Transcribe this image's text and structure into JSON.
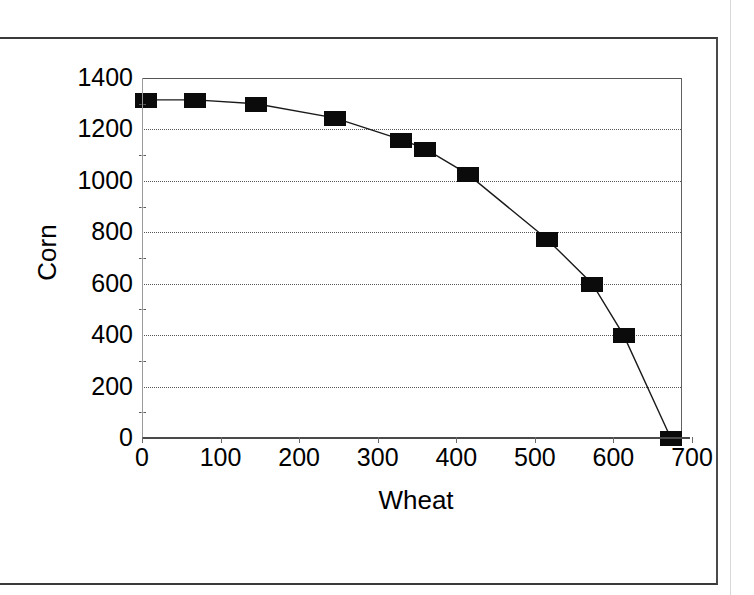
{
  "figure": {
    "background_color": "#ffffff",
    "ink_color": "#000000",
    "marker_color": "#0b0b0b"
  },
  "chart_data": {
    "type": "line",
    "title": "",
    "subtitle": "",
    "xlabel": "Wheat",
    "ylabel": "Corn",
    "xlim": [
      0,
      700
    ],
    "ylim": [
      0,
      1400
    ],
    "x_ticks": [
      0,
      100,
      200,
      300,
      400,
      500,
      600,
      700
    ],
    "x_tick_labels": [
      "0",
      "100",
      "200",
      "300",
      "400",
      "500",
      "600",
      "700"
    ],
    "y_ticks": [
      0,
      200,
      400,
      600,
      800,
      1000,
      1200,
      1400
    ],
    "y_tick_labels": [
      "0",
      "200",
      "400",
      "600",
      "800",
      "1000",
      "1200",
      "1400"
    ],
    "y_minor_ticks": [
      100,
      300,
      500,
      700,
      900,
      1100,
      1300
    ],
    "grid": true,
    "grid_axis": "y",
    "grid_style": "dotted",
    "legend": false,
    "legend_position": "none",
    "marker_style": "filled-square",
    "line_style": "solid",
    "series": [
      {
        "name": "Production possibilities frontier",
        "x": [
          5,
          68,
          145,
          245,
          330,
          360,
          415,
          515,
          573,
          613,
          673
        ],
        "y": [
          1315,
          1315,
          1300,
          1245,
          1160,
          1125,
          1025,
          775,
          600,
          400,
          0
        ],
        "points": [
          {
            "x": 5,
            "y": 1315
          },
          {
            "x": 68,
            "y": 1315
          },
          {
            "x": 145,
            "y": 1300
          },
          {
            "x": 245,
            "y": 1245
          },
          {
            "x": 330,
            "y": 1160
          },
          {
            "x": 360,
            "y": 1125
          },
          {
            "x": 415,
            "y": 1025
          },
          {
            "x": 515,
            "y": 775
          },
          {
            "x": 573,
            "y": 600
          },
          {
            "x": 613,
            "y": 400
          },
          {
            "x": 673,
            "y": 0
          }
        ]
      }
    ]
  }
}
